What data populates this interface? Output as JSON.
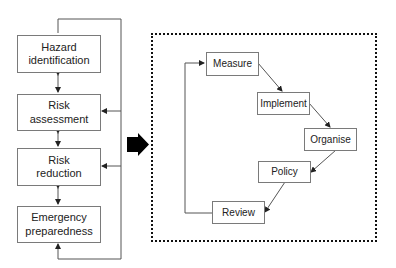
{
  "diagram": {
    "left_column": {
      "boxes": [
        {
          "id": "hazard",
          "label": "Hazard identification",
          "line1": "Hazard",
          "line2": "identification"
        },
        {
          "id": "assessment",
          "label": "Risk assessment",
          "line1": "Risk",
          "line2": "assessment"
        },
        {
          "id": "reduction",
          "label": "Risk reduction",
          "line1": "Risk",
          "line2": "reduction"
        },
        {
          "id": "emergency",
          "label": "Emergency preparedness",
          "line1": "Emergency",
          "line2": "preparedness"
        }
      ],
      "connections": [
        {
          "from": "hazard",
          "to": "assessment",
          "type": "bidirectional"
        },
        {
          "from": "assessment",
          "to": "reduction",
          "type": "bidirectional"
        },
        {
          "from": "reduction",
          "to": "emergency",
          "type": "bidirectional"
        },
        {
          "from": "feedback-loop",
          "to": "hazard",
          "type": "arrow"
        },
        {
          "from": "feedback-loop",
          "to": "assessment",
          "type": "arrow"
        },
        {
          "from": "feedback-loop",
          "to": "reduction",
          "type": "arrow"
        },
        {
          "from": "feedback-loop",
          "to": "emergency",
          "type": "arrow"
        }
      ]
    },
    "transition_arrow": "right-arrow",
    "right_cycle": {
      "boxes": [
        {
          "id": "measure",
          "label": "Measure"
        },
        {
          "id": "implement",
          "label": "Implement"
        },
        {
          "id": "organise",
          "label": "Organise"
        },
        {
          "id": "policy",
          "label": "Policy"
        },
        {
          "id": "review",
          "label": "Review"
        }
      ],
      "connections": [
        {
          "from": "measure",
          "to": "implement"
        },
        {
          "from": "implement",
          "to": "organise"
        },
        {
          "from": "organise",
          "to": "policy"
        },
        {
          "from": "policy",
          "to": "review"
        },
        {
          "from": "review",
          "to": "measure"
        }
      ]
    },
    "colors": {
      "line": "#555555",
      "box_border": "#7a7a7a",
      "text": "#222222",
      "frame": "#111111"
    }
  }
}
